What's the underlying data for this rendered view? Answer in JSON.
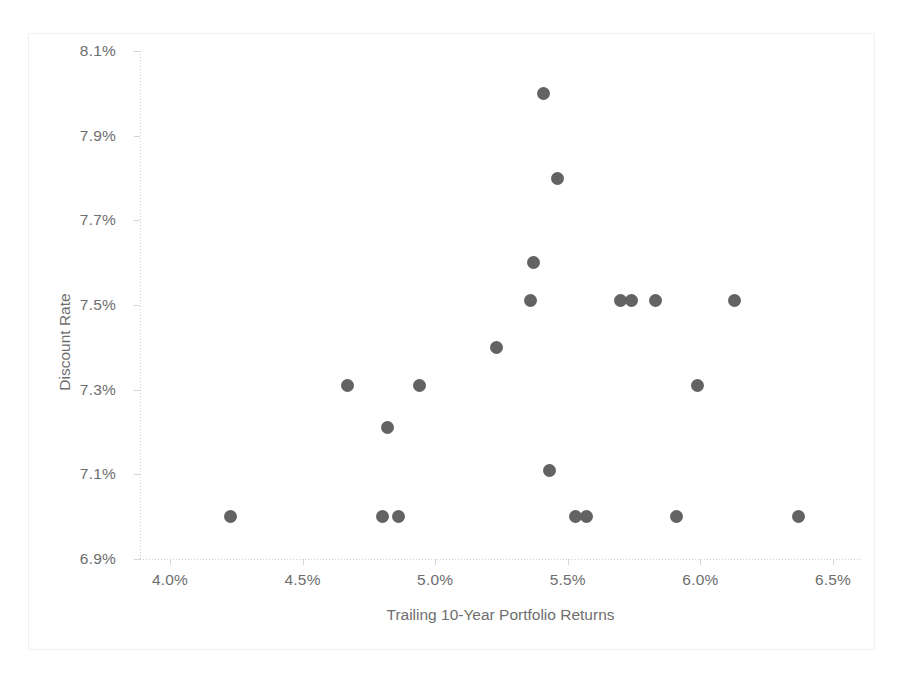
{
  "chart_data": {
    "type": "scatter",
    "title": "",
    "xlabel": "Trailing 10-Year Portfolio Returns",
    "ylabel": "Discount Rate",
    "xlim": [
      4.0,
      6.5
    ],
    "ylim": [
      6.9,
      8.1
    ],
    "grid": false,
    "legend": null,
    "x_unit": "%",
    "y_unit": "%",
    "xticks": [
      "4.0%",
      "4.5%",
      "5.0%",
      "5.5%",
      "6.0%",
      "6.5%"
    ],
    "xtick_values": [
      4.0,
      4.5,
      5.0,
      5.5,
      6.0,
      6.5
    ],
    "yticks": [
      "8.1%",
      "7.9%",
      "7.7%",
      "7.5%",
      "7.3%",
      "7.1%",
      "6.9%"
    ],
    "ytick_values": [
      8.1,
      7.9,
      7.7,
      7.5,
      7.3,
      7.1,
      6.9
    ],
    "marker_color": "#636363",
    "points": [
      {
        "x": 5.41,
        "y": 8.0
      },
      {
        "x": 5.46,
        "y": 7.8
      },
      {
        "x": 5.37,
        "y": 7.6
      },
      {
        "x": 5.36,
        "y": 7.51
      },
      {
        "x": 5.7,
        "y": 7.51
      },
      {
        "x": 5.74,
        "y": 7.51
      },
      {
        "x": 5.83,
        "y": 7.51
      },
      {
        "x": 6.13,
        "y": 7.51
      },
      {
        "x": 5.23,
        "y": 7.4
      },
      {
        "x": 4.67,
        "y": 7.31
      },
      {
        "x": 4.94,
        "y": 7.31
      },
      {
        "x": 5.99,
        "y": 7.31
      },
      {
        "x": 4.82,
        "y": 7.21
      },
      {
        "x": 5.43,
        "y": 7.11
      },
      {
        "x": 4.23,
        "y": 7.0
      },
      {
        "x": 4.8,
        "y": 7.0
      },
      {
        "x": 4.86,
        "y": 7.0
      },
      {
        "x": 5.53,
        "y": 7.0
      },
      {
        "x": 5.57,
        "y": 7.0
      },
      {
        "x": 5.91,
        "y": 7.0
      },
      {
        "x": 6.37,
        "y": 7.0
      }
    ]
  },
  "axes": {
    "y_title": "Discount Rate",
    "x_title": "Trailing 10-Year Portfolio Returns"
  }
}
